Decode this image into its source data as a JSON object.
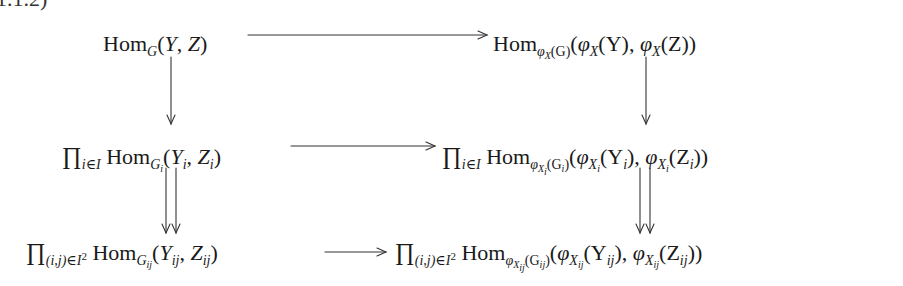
{
  "equation_label": "1.1.2)",
  "diagram": {
    "type": "commutative-diagram",
    "rows": [
      {
        "left": {
          "hom": "Hom",
          "hom_sub": "G",
          "open": "(",
          "a": "Y",
          "comma": ", ",
          "b": "Z",
          "close": ")"
        },
        "right": {
          "hom": "Hom",
          "hom_sub_phi": "φ",
          "hom_sub_x": "X",
          "hom_sub_rest": "(G)",
          "open": "(",
          "phi1": "φ",
          "x1": "X",
          "arg1": "(Y)",
          "comma": ", ",
          "phi2": "φ",
          "x2": "X",
          "arg2": "(Z)",
          "close": ")"
        },
        "horizontal_arrow": "single"
      },
      {
        "left": {
          "prod": "∏",
          "prod_sub": "i∈I",
          "hom": "Hom",
          "hom_sub": "G",
          "hom_subsub": "i",
          "open": "(",
          "a": "Y",
          "a_sub": "i",
          "comma": ", ",
          "b": "Z",
          "b_sub": "i",
          "close": ")"
        },
        "right": {
          "prod": "∏",
          "prod_sub": "i∈I",
          "hom": "Hom",
          "hom_sub_phi": "φ",
          "hom_sub_x": "X",
          "hom_sub_xsub": "i",
          "hom_sub_open": "(G",
          "hom_sub_gsub": "i",
          "hom_sub_close": ")",
          "open": "(",
          "phi1": "φ",
          "x1": "X",
          "x1_sub": "i",
          "arg1_open": "(Y",
          "arg1_sub": "i",
          "arg1_close": ")",
          "comma": ", ",
          "phi2": "φ",
          "x2": "X",
          "x2_sub": "i",
          "arg2_open": "(Z",
          "arg2_sub": "i",
          "arg2_close": ")",
          "close": ")"
        },
        "horizontal_arrow": "single"
      },
      {
        "left": {
          "prod": "∏",
          "prod_sub": "(i,j)∈I",
          "prod_sup": "2",
          "hom": "Hom",
          "hom_sub": "G",
          "hom_subsub": "ij",
          "open": "(",
          "a": "Y",
          "a_sub": "ij",
          "comma": ", ",
          "b": "Z",
          "b_sub": "ij",
          "close": ")"
        },
        "right": {
          "prod": "∏",
          "prod_sub": "(i,j)∈I",
          "prod_sup": "2",
          "hom": "Hom",
          "hom_sub_phi": "φ",
          "hom_sub_x": "X",
          "hom_sub_xsub": "ij",
          "hom_sub_open": "(G",
          "hom_sub_gsub": "ij",
          "hom_sub_close": ")",
          "open": "(",
          "phi1": "φ",
          "x1": "X",
          "x1_sub": "ij",
          "arg1_open": "(Y",
          "arg1_sub": "ij",
          "arg1_close": ")",
          "comma": ", ",
          "phi2": "φ",
          "x2": "X",
          "x2_sub": "ij",
          "arg2_open": "(Z",
          "arg2_sub": "ij",
          "arg2_close": ")",
          "close": ")"
        },
        "horizontal_arrow": "single"
      }
    ],
    "vertical_arrows": [
      {
        "from_row": 0,
        "to_row": 1,
        "column": "left",
        "style": "single"
      },
      {
        "from_row": 0,
        "to_row": 1,
        "column": "right",
        "style": "single"
      },
      {
        "from_row": 1,
        "to_row": 2,
        "column": "left",
        "style": "double"
      },
      {
        "from_row": 1,
        "to_row": 2,
        "column": "right",
        "style": "double"
      }
    ]
  }
}
